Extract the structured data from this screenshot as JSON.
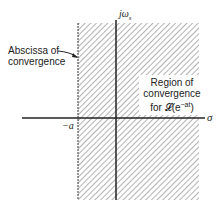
{
  "diagram": {
    "vertical_axis_label": "jω",
    "vertical_axis_sub": "s",
    "horizontal_axis_label": "σ",
    "abscissa_point": "−a",
    "abscissa_annotation": [
      "Abscissa of",
      "convergence"
    ],
    "region_label": [
      "Region of",
      "convergence",
      "for 𝓛(e"
    ],
    "region_exp": "−at",
    "region_close": ")",
    "colors": {
      "line": "#222222",
      "hatch": "#555555",
      "background": "#ffffff"
    }
  }
}
